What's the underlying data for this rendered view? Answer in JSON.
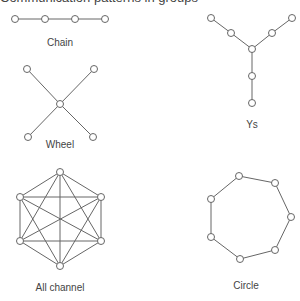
{
  "caption": "Communication patterns in groups",
  "node_radius": 3.5,
  "colors": {
    "stroke": "#666666",
    "fill": "#ffffff",
    "text": "#444444"
  },
  "networks": [
    {
      "name": "Chain",
      "label_pos": [
        60,
        46
      ],
      "nodes": [
        [
          15,
          19
        ],
        [
          45,
          19
        ],
        [
          75,
          19
        ],
        [
          105,
          19
        ]
      ],
      "edges": [
        [
          0,
          1
        ],
        [
          1,
          2
        ],
        [
          2,
          3
        ]
      ]
    },
    {
      "name": "Ys",
      "label_pos": [
        252,
        128
      ],
      "nodes": [
        [
          211,
          18
        ],
        [
          231,
          33
        ],
        [
          252,
          49
        ],
        [
          272,
          33
        ],
        [
          292,
          18
        ],
        [
          252,
          76
        ],
        [
          252,
          103
        ]
      ],
      "edges": [
        [
          0,
          1
        ],
        [
          1,
          2
        ],
        [
          4,
          3
        ],
        [
          3,
          2
        ],
        [
          2,
          5
        ],
        [
          5,
          6
        ]
      ]
    },
    {
      "name": "Wheel",
      "label_pos": [
        60,
        148
      ],
      "nodes": [
        [
          60,
          104
        ],
        [
          27,
          69
        ],
        [
          94,
          69
        ],
        [
          28,
          137
        ],
        [
          93,
          137
        ]
      ],
      "edges": [
        [
          0,
          1
        ],
        [
          0,
          2
        ],
        [
          0,
          3
        ],
        [
          0,
          4
        ]
      ]
    },
    {
      "name": "All channel",
      "label_pos": [
        60,
        291
      ],
      "nodes": [
        [
          60,
          172
        ],
        [
          101,
          197
        ],
        [
          101,
          241
        ],
        [
          60,
          266
        ],
        [
          20,
          241
        ],
        [
          20,
          197
        ]
      ],
      "edges": "all"
    },
    {
      "name": "Circle",
      "label_pos": [
        246,
        289
      ],
      "nodes": [
        [
          239,
          176
        ],
        [
          275,
          183
        ],
        [
          291,
          217
        ],
        [
          275,
          250
        ],
        [
          240,
          259
        ],
        [
          211,
          237
        ],
        [
          211,
          199
        ]
      ],
      "edges": [
        [
          0,
          1
        ],
        [
          1,
          2
        ],
        [
          2,
          3
        ],
        [
          3,
          4
        ],
        [
          4,
          5
        ],
        [
          5,
          6
        ],
        [
          6,
          0
        ]
      ]
    }
  ]
}
